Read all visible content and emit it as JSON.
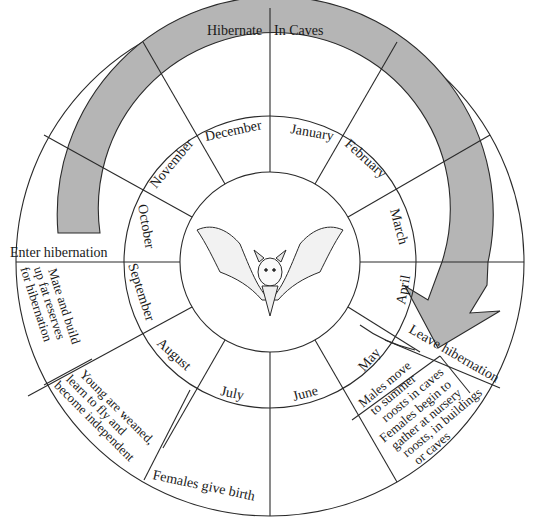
{
  "center": {
    "x": 270,
    "y": 261
  },
  "radii": {
    "bat": 90,
    "months": 146,
    "arrow_inner": 176,
    "arrow_outer": 218,
    "outer": 254
  },
  "colors": {
    "arrow_fill": "#b5b5b5",
    "line": "#2a2a2a",
    "text": "#1a1a1a",
    "background": "#ffffff"
  },
  "months": [
    {
      "label": "January",
      "start_deg": 0
    },
    {
      "label": "February",
      "start_deg": 30
    },
    {
      "label": "March",
      "start_deg": 60
    },
    {
      "label": "April",
      "start_deg": 90
    },
    {
      "label": "May",
      "start_deg": 120
    },
    {
      "label": "June",
      "start_deg": 150
    },
    {
      "label": "July",
      "start_deg": 180
    },
    {
      "label": "August",
      "start_deg": 210
    },
    {
      "label": "September",
      "start_deg": 240
    },
    {
      "label": "October",
      "start_deg": 270
    },
    {
      "label": "November",
      "start_deg": 300
    },
    {
      "label": "December",
      "start_deg": 330
    }
  ],
  "arrow": {
    "label": "Hibernate In Caves",
    "label_part1": "Hibernate",
    "label_part2": "In Caves",
    "from": "Enter hibernation",
    "to": "Leave hibernation"
  },
  "events": {
    "enter_hibernation": "Enter hibernation",
    "leave_hibernation": "Leave hibernation",
    "mate": [
      "Mate and build",
      "up fat reserves",
      "for hibernation"
    ],
    "weaned": [
      "Young are weaned,",
      "learn to fly and",
      "become independent"
    ],
    "give_birth": "Females give birth",
    "males_move": [
      "Males move",
      "to summer",
      "roosts in caves"
    ],
    "females_gather": [
      "Females begin to",
      "gather at nursery",
      "roosts, in buildings",
      "or caves"
    ]
  },
  "center_image": {
    "icon": "bat-illustration"
  }
}
